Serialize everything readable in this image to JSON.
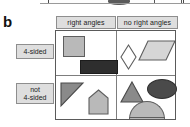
{
  "panel": {
    "letter": "b"
  },
  "matrix": {
    "column_headers": [
      {
        "key": "right-angles",
        "label": "right angles"
      },
      {
        "key": "no-right-angles",
        "label": "no right angles"
      }
    ],
    "row_headers": [
      {
        "key": "4-sided",
        "label": "4-sided",
        "lines": [
          "4-sided"
        ]
      },
      {
        "key": "not-4-sided",
        "label": "not 4-sided",
        "lines": [
          "not",
          "4-sided"
        ]
      }
    ],
    "cells": [
      {
        "key": "4sided-right",
        "row": "4-sided",
        "column": "right angles",
        "shapes": [
          {
            "name": "square",
            "fill": "#b9b9b9",
            "stroke": "#5e5e5e"
          },
          {
            "name": "rectangle",
            "fill": "#2e2e2e",
            "stroke": "#1c1c1c"
          }
        ]
      },
      {
        "key": "4sided-noright",
        "row": "4-sided",
        "column": "no right angles",
        "shapes": [
          {
            "name": "rhombus",
            "fill": "#ffffff",
            "stroke": "#5e5e5e"
          },
          {
            "name": "parallelogram",
            "fill": "#d6d6d6",
            "stroke": "#5e5e5e"
          }
        ]
      },
      {
        "key": "not4sided-right",
        "row": "not 4-sided",
        "column": "right angles",
        "shapes": [
          {
            "name": "right-triangle",
            "fill": "#8a8a8a",
            "stroke": "#4a4a4a"
          },
          {
            "name": "pentagon",
            "fill": "#b9b9b9",
            "stroke": "#5e5e5e"
          }
        ]
      },
      {
        "key": "not4sided-noright",
        "row": "not 4-sided",
        "column": "no right angles",
        "shapes": [
          {
            "name": "triangle",
            "fill": "#8a8a8a",
            "stroke": "#4a4a4a"
          },
          {
            "name": "ellipse",
            "fill": "#4a4a4a",
            "stroke": "#303030"
          },
          {
            "name": "semicircle",
            "fill": "#b9b9b9",
            "stroke": "#5e5e5e"
          }
        ]
      }
    ]
  },
  "colors": {
    "header_fill": "#dedede",
    "header_border": "#8e8e8e",
    "grid_border": "#5a5a5a",
    "grid_divider": "#7d7d7d",
    "light_gray_shape": "#b9b9b9",
    "mid_gray_shape": "#8a8a8a",
    "dark_shape": "#2e2e2e",
    "page_background": "#ffffff"
  }
}
